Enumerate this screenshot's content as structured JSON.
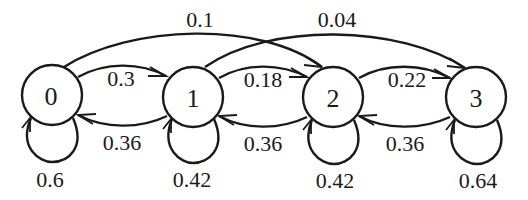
{
  "diagram": {
    "type": "markov-chain-state-diagram",
    "nodes": [
      {
        "id": "0",
        "label": "0"
      },
      {
        "id": "1",
        "label": "1"
      },
      {
        "id": "2",
        "label": "2"
      },
      {
        "id": "3",
        "label": "3"
      }
    ],
    "edges": {
      "e01": {
        "from": "0",
        "to": "1",
        "label": "0.3"
      },
      "e02": {
        "from": "0",
        "to": "2",
        "label": "0.1"
      },
      "e00": {
        "from": "0",
        "to": "0",
        "label": "0.6"
      },
      "e10": {
        "from": "1",
        "to": "0",
        "label": "0.36"
      },
      "e12": {
        "from": "1",
        "to": "2",
        "label": "0.18"
      },
      "e13": {
        "from": "1",
        "to": "3",
        "label": "0.04"
      },
      "e11": {
        "from": "1",
        "to": "1",
        "label": "0.42"
      },
      "e21": {
        "from": "2",
        "to": "1",
        "label": "0.36"
      },
      "e23": {
        "from": "2",
        "to": "3",
        "label": "0.22"
      },
      "e22": {
        "from": "2",
        "to": "2",
        "label": "0.42"
      },
      "e32": {
        "from": "3",
        "to": "2",
        "label": "0.36"
      },
      "e33": {
        "from": "3",
        "to": "3",
        "label": "0.64"
      }
    }
  }
}
